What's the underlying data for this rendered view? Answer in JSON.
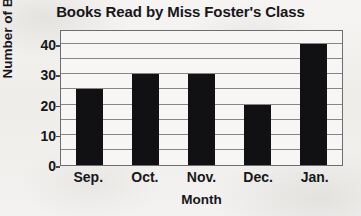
{
  "chart_data": {
    "type": "bar",
    "title": "Books Read by Miss Foster's Class",
    "xlabel": "Month",
    "ylabel": "Number of Books",
    "categories": [
      "Sep.",
      "Oct.",
      "Nov.",
      "Dec.",
      "Jan."
    ],
    "values": [
      25,
      30,
      30,
      20,
      40
    ],
    "ylim": [
      0,
      45
    ],
    "ytick_labels": [
      "0",
      "10",
      "20",
      "30",
      "40"
    ],
    "ytick_values": [
      0,
      10,
      20,
      30,
      40
    ],
    "gridlines": {
      "horizontal": true,
      "vertical": false,
      "minor_step": 5,
      "minor_values": [
        5,
        10,
        15,
        20,
        25,
        30,
        35,
        40
      ]
    },
    "legend": null,
    "colors": {
      "bar": "#111114",
      "gridline": "#86868a",
      "frame": "#6d6d70",
      "text": "#17171a",
      "plot_background": "#f7f6f4",
      "page_background": "#f2f1ef"
    }
  }
}
